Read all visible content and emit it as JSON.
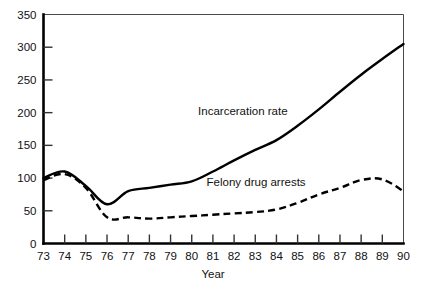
{
  "chart_data": {
    "type": "line",
    "title": "",
    "subtitle": "",
    "xlabel": "Year",
    "ylabel": "",
    "x": [
      73,
      74,
      75,
      76,
      77,
      78,
      79,
      80,
      81,
      82,
      83,
      84,
      85,
      86,
      87,
      88,
      89,
      90
    ],
    "categories": [
      "73",
      "74",
      "75",
      "76",
      "77",
      "78",
      "79",
      "80",
      "81",
      "82",
      "83",
      "84",
      "85",
      "86",
      "87",
      "88",
      "89",
      "90"
    ],
    "xtick_labels": [
      "73",
      "74",
      "75",
      "76",
      "77",
      "78",
      "79",
      "80",
      "81",
      "82",
      "83",
      "84",
      "85",
      "86",
      "87",
      "88",
      "89",
      "90"
    ],
    "ytick_labels": [
      "0",
      "50",
      "100",
      "150",
      "200",
      "250",
      "300",
      "350"
    ],
    "ytick_values": [
      0,
      50,
      100,
      150,
      200,
      250,
      300,
      350
    ],
    "xlim": [
      73,
      90
    ],
    "ylim": [
      0,
      350
    ],
    "grid": false,
    "legend_position": "inline-annotation",
    "series": [
      {
        "name": "Incarceration rate",
        "style": "solid",
        "color": "#000000",
        "values": [
          100,
          110,
          88,
          60,
          80,
          85,
          90,
          95,
          110,
          127,
          143,
          158,
          180,
          205,
          232,
          258,
          282,
          305
        ]
      },
      {
        "name": "Felony drug arrests",
        "style": "dashed",
        "color": "#000000",
        "values": [
          97,
          106,
          85,
          40,
          40,
          38,
          40,
          42,
          44,
          46,
          48,
          52,
          62,
          75,
          85,
          97,
          98,
          80
        ]
      }
    ],
    "annotations": [
      {
        "text": "Incarceration rate",
        "x": 80.3,
        "y": 196
      },
      {
        "text": "Felony drug arrests",
        "x": 80.7,
        "y": 88
      }
    ]
  }
}
